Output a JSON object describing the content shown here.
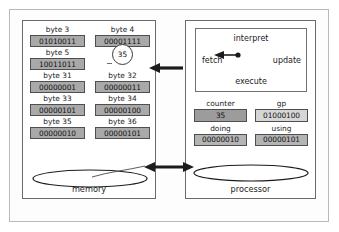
{
  "diagram": {
    "memory_panel": {
      "label": "memory",
      "rows": [
        {
          "left": {
            "label": "byte 3",
            "value": "01010011",
            "shaded": true
          },
          "right": {
            "label": "byte 4",
            "value": "00001111",
            "shaded": true
          }
        },
        {
          "left": {
            "label": "byte 5",
            "value": "10011011",
            "shaded": true
          },
          "right": {
            "label": "",
            "value": "35",
            "shaded": false,
            "circled": true
          }
        },
        {
          "left": {
            "label": "byte 31",
            "value": "00000001",
            "shaded": true
          },
          "right": {
            "label": "byte 32",
            "value": "00000011",
            "shaded": true
          }
        },
        {
          "left": {
            "label": "byte 33",
            "value": "00000101",
            "shaded": true
          },
          "right": {
            "label": "byte 34",
            "value": "00000100",
            "shaded": true
          }
        },
        {
          "left": {
            "label": "byte 35",
            "value": "00000010",
            "shaded": true,
            "circled_pair": true
          },
          "right": {
            "label": "byte 36",
            "value": "00000101",
            "shaded": true,
            "circled_pair": true
          }
        }
      ]
    },
    "processor_panel": {
      "label": "processor",
      "interpret_box": {
        "top_word": "interpret",
        "bottom_word": "execute",
        "left_word": "fetch",
        "right_word": "update"
      },
      "registers": [
        {
          "left": {
            "label": "counter",
            "value": "35",
            "shade": "dark"
          },
          "right": {
            "label": "gp",
            "value": "01000100",
            "shade": "light"
          }
        },
        {
          "left": {
            "label": "doing",
            "value": "00000010",
            "shade": "mid",
            "circled_pair": true
          },
          "right": {
            "label": "using",
            "value": "00000101",
            "shade": "mid",
            "circled_pair": true
          }
        }
      ]
    },
    "connectors": {
      "top_arrow": "arrow-left",
      "bottom_arrow": "arrow-double",
      "curve": "byte36-to-bottom-arrow"
    },
    "colors": {
      "cell_fill": "#a9a9a9",
      "cell_border": "#4f4f4f",
      "panel_border": "#6a6a6a",
      "frame_border": "#b9b9b9",
      "arrow": "#1c1c1c",
      "text": "#121212"
    }
  }
}
